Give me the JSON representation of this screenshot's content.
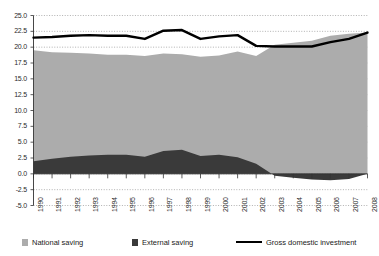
{
  "chart_data": {
    "type": "area",
    "title": "",
    "xlabel": "",
    "ylabel": "",
    "grid": true,
    "legend_position": "bottom",
    "ylim": [
      -5.0,
      25.0
    ],
    "ytick_step": 2.5,
    "yticks": [
      "25.0",
      "22.5",
      "20.0",
      "17.5",
      "15.0",
      "12.5",
      "10.0",
      "7.5",
      "5.0",
      "2.5",
      "0.0",
      "-2.5",
      "-5.0"
    ],
    "ytick_values": [
      25.0,
      22.5,
      20.0,
      17.5,
      15.0,
      12.5,
      10.0,
      7.5,
      5.0,
      2.5,
      0.0,
      -2.5,
      -5.0
    ],
    "categories": [
      "1990",
      "1991",
      "1992",
      "1993",
      "1994",
      "1995",
      "1996",
      "1997",
      "1998",
      "1999",
      "2000",
      "2001",
      "2002",
      "2003",
      "2004",
      "2005",
      "2006",
      "2007",
      "2008"
    ],
    "x": [
      1990,
      1991,
      1992,
      1993,
      1994,
      1995,
      1996,
      1997,
      1998,
      1999,
      2000,
      2001,
      2002,
      2003,
      2004,
      2005,
      2006,
      2007,
      2008
    ],
    "series": [
      {
        "name": "National saving",
        "type": "area",
        "color": "#ACACAC",
        "stacked": true,
        "values": [
          19.5,
          19.2,
          19.1,
          19.0,
          18.8,
          18.8,
          18.6,
          19.0,
          18.9,
          18.5,
          18.7,
          19.3,
          18.6,
          20.4,
          20.7,
          21.0,
          21.8,
          22.1,
          22.3
        ]
      },
      {
        "name": "External saving",
        "type": "area",
        "color": "#3A3A3A",
        "stacked": true,
        "values": [
          2.0,
          2.4,
          2.7,
          2.9,
          3.0,
          3.0,
          2.7,
          3.6,
          3.8,
          2.8,
          3.0,
          2.6,
          1.6,
          -0.3,
          -0.6,
          -0.9,
          -1.0,
          -0.8,
          0.0
        ]
      },
      {
        "name": "Gross domestic investment",
        "type": "line",
        "color": "#000000",
        "values": [
          21.5,
          21.6,
          21.8,
          21.9,
          21.8,
          21.8,
          21.3,
          22.6,
          22.7,
          21.3,
          21.7,
          21.9,
          20.2,
          20.1,
          20.1,
          20.1,
          20.8,
          21.3,
          22.3
        ]
      }
    ]
  },
  "legend": {
    "items": [
      {
        "label": "National saving",
        "marker": "square-swatch",
        "color": "#ACACAC"
      },
      {
        "label": "External saving",
        "marker": "square-swatch",
        "color": "#3A3A3A"
      },
      {
        "label": "Gross domestic investment",
        "marker": "line-swatch",
        "color": "#000000"
      }
    ]
  }
}
